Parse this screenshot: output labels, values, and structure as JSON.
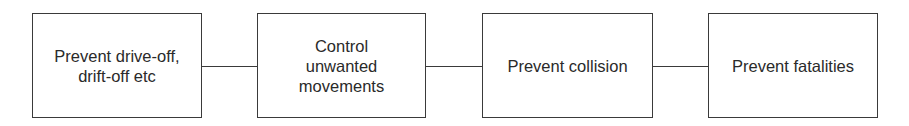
{
  "diagram": {
    "type": "flow",
    "nodes": [
      {
        "id": "n1",
        "label": "Prevent drive-off, drift-off etc"
      },
      {
        "id": "n2",
        "label": "Control unwanted movements"
      },
      {
        "id": "n3",
        "label": "Prevent collision"
      },
      {
        "id": "n4",
        "label": "Prevent fatalities"
      }
    ],
    "edges": [
      {
        "from": "n1",
        "to": "n2"
      },
      {
        "from": "n2",
        "to": "n3"
      },
      {
        "from": "n3",
        "to": "n4"
      }
    ],
    "colors": {
      "stroke": "#3a3a3a",
      "text": "#2a2a2a",
      "background": "#ffffff"
    }
  }
}
